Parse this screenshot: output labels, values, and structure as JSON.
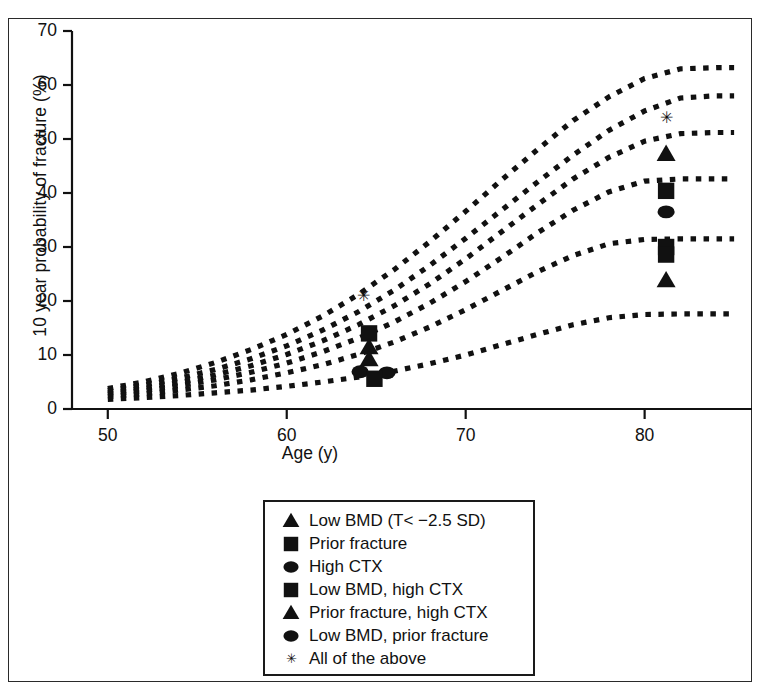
{
  "chart_data": {
    "type": "line",
    "title": "",
    "xlabel": "Age (y)",
    "ylabel": "10 year probability of fracture (%)",
    "xlim": [
      48,
      86
    ],
    "ylim": [
      0,
      70
    ],
    "xticks": [
      50,
      60,
      70,
      80
    ],
    "yticks": [
      0,
      10,
      20,
      30,
      40,
      50,
      60,
      70
    ],
    "grid": false,
    "legend_position": "below-plot",
    "line_style": "dotted",
    "x": [
      50,
      52,
      54,
      56,
      58,
      60,
      62,
      64,
      66,
      68,
      70,
      72,
      74,
      76,
      78,
      80,
      82,
      84,
      85
    ],
    "series": [
      {
        "name": "All of the above",
        "marker": "star",
        "values": [
          3.8,
          5.0,
          6.6,
          8.6,
          11.0,
          13.8,
          17.2,
          21.2,
          25.8,
          31.0,
          36.6,
          42.4,
          48.0,
          53.4,
          57.8,
          61.2,
          63.0,
          63.2,
          63.2
        ],
        "plateau": 63.0
      },
      {
        "name": "Low BMD, prior fracture",
        "marker": "circle",
        "values": [
          3.4,
          4.4,
          5.7,
          7.3,
          9.3,
          11.7,
          14.6,
          18.0,
          22.0,
          26.6,
          31.6,
          36.8,
          42.0,
          47.0,
          51.6,
          55.2,
          57.6,
          58.0,
          58.0
        ],
        "plateau": 57.8
      },
      {
        "name": "Prior fracture, high CTX",
        "marker": "triangle",
        "values": [
          3.0,
          3.8,
          4.9,
          6.3,
          8.0,
          10.1,
          12.6,
          15.6,
          19.1,
          23.2,
          27.8,
          32.8,
          37.8,
          42.6,
          46.6,
          49.6,
          51.0,
          51.2,
          51.2
        ],
        "plateau": 51.0
      },
      {
        "name": "Low BMD, high CTX",
        "marker": "square",
        "values": [
          2.7,
          3.4,
          4.3,
          5.4,
          6.8,
          8.5,
          10.6,
          13.1,
          16.1,
          19.6,
          23.6,
          28.0,
          32.6,
          36.8,
          40.2,
          42.2,
          42.6,
          42.6,
          42.6
        ],
        "plateau": 42.5
      },
      {
        "name": "High CTX / Prior fracture",
        "marker": "circle",
        "values": [
          2.3,
          2.8,
          3.5,
          4.3,
          5.4,
          6.7,
          8.2,
          10.1,
          12.4,
          15.2,
          18.4,
          21.9,
          25.4,
          28.4,
          30.6,
          31.4,
          31.5,
          31.5,
          31.5
        ],
        "plateau": 31.4
      },
      {
        "name": "Low BMD",
        "marker": "triangle",
        "values": [
          1.8,
          2.1,
          2.5,
          3.0,
          3.5,
          4.2,
          5.0,
          5.9,
          7.0,
          8.4,
          10.0,
          11.9,
          13.8,
          15.6,
          16.9,
          17.5,
          17.6,
          17.6,
          17.6
        ],
        "plateau": 17.5
      }
    ],
    "data_points": [
      {
        "label": "All of the above",
        "marker": "star",
        "x": 64.3,
        "y": 21.0
      },
      {
        "label": "Low BMD, high CTX",
        "marker": "square",
        "x": 64.6,
        "y": 14.0
      },
      {
        "label": "Prior fracture, high CTX",
        "marker": "triangle",
        "x": 64.6,
        "y": 11.4
      },
      {
        "label": "Low BMD, prior fracture",
        "marker": "triangle",
        "x": 64.6,
        "y": 9.2
      },
      {
        "label": "High CTX",
        "marker": "circle",
        "x": 64.1,
        "y": 6.9
      },
      {
        "label": "Prior fracture",
        "marker": "circle",
        "x": 65.6,
        "y": 6.7
      },
      {
        "label": "Low BMD",
        "marker": "square",
        "x": 64.9,
        "y": 5.6
      },
      {
        "label": "All of the above",
        "marker": "star",
        "x": 81.2,
        "y": 54.0
      },
      {
        "label": "Low BMD, prior fracture",
        "marker": "triangle",
        "x": 81.2,
        "y": 47.2
      },
      {
        "label": "Prior fracture, high CTX",
        "marker": "square",
        "x": 81.2,
        "y": 40.4
      },
      {
        "label": "Low BMD, high CTX",
        "marker": "circle",
        "x": 81.2,
        "y": 36.5
      },
      {
        "label": "High CTX",
        "marker": "square",
        "x": 81.2,
        "y": 30.0
      },
      {
        "label": "Prior fracture",
        "marker": "square",
        "x": 81.2,
        "y": 28.6
      },
      {
        "label": "Low BMD",
        "marker": "triangle",
        "x": 81.2,
        "y": 23.8
      }
    ]
  },
  "axes": {
    "y_title": "10 year probability of fracture (%)",
    "x_title": "Age (y)",
    "y_tick_labels": [
      "0",
      "10",
      "20",
      "30",
      "40",
      "50",
      "60",
      "70"
    ],
    "x_tick_labels": [
      "50",
      "60",
      "70",
      "80"
    ]
  },
  "legend": {
    "items": [
      {
        "marker": "triangle",
        "label": "Low BMD (T< −2.5 SD)"
      },
      {
        "marker": "square",
        "label": "Prior fracture"
      },
      {
        "marker": "circle",
        "label": "High CTX"
      },
      {
        "marker": "square",
        "label": "Low BMD, high CTX"
      },
      {
        "marker": "triangle",
        "label": "Prior fracture, high CTX"
      },
      {
        "marker": "circle",
        "label": "Low BMD, prior fracture"
      },
      {
        "marker": "star",
        "label": "All of the above"
      }
    ]
  },
  "colors": {
    "ink": "#111111",
    "frame": "#2a2a2a",
    "background": "#ffffff"
  }
}
